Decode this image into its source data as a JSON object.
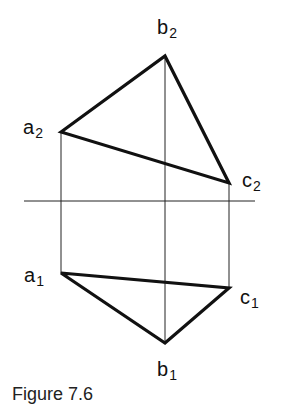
{
  "diagram": {
    "type": "orthographic-projection",
    "ground_line": {
      "x1": 24,
      "y1": 201,
      "x2": 255,
      "y2": 201
    },
    "points": {
      "a2": {
        "x": 61,
        "y": 132,
        "letter": "a",
        "sub": "2"
      },
      "b2": {
        "x": 165,
        "y": 56,
        "letter": "b",
        "sub": "2"
      },
      "c2": {
        "x": 229,
        "y": 183,
        "letter": "c",
        "sub": "2"
      },
      "a1": {
        "x": 61,
        "y": 273,
        "letter": "a",
        "sub": "1"
      },
      "b1": {
        "x": 165,
        "y": 343,
        "letter": "b",
        "sub": "1"
      },
      "c1": {
        "x": 229,
        "y": 288,
        "letter": "c",
        "sub": "1"
      }
    },
    "labels": {
      "a2": {
        "letter": "a",
        "sub": "2"
      },
      "b2": {
        "letter": "b",
        "sub": "2"
      },
      "c2": {
        "letter": "c",
        "sub": "2"
      },
      "a1": {
        "letter": "a",
        "sub": "1"
      },
      "b1": {
        "letter": "b",
        "sub": "1"
      },
      "c1": {
        "letter": "c",
        "sub": "1"
      }
    },
    "caption": "Figure 7.6"
  }
}
